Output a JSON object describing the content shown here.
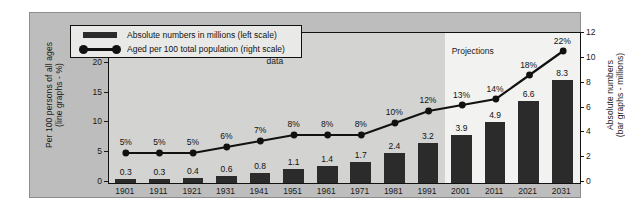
{
  "chart_data": {
    "type": "bar",
    "title": "",
    "xlabel": "",
    "categories": [
      "1901",
      "1911",
      "1921",
      "1931",
      "1941",
      "1951",
      "1961",
      "1971",
      "1981",
      "1991",
      "2001",
      "2011",
      "2021",
      "2031"
    ],
    "series": [
      {
        "name": "Absolute numbers in millions (left scale)",
        "type": "bar",
        "axis": "right",
        "values": [
          0.3,
          0.3,
          0.4,
          0.6,
          0.8,
          1.1,
          1.4,
          1.7,
          2.4,
          3.2,
          3.9,
          4.9,
          6.6,
          8.3
        ],
        "labels": [
          "0.3",
          "0.3",
          "0.4",
          "0.6",
          "0.8",
          "1.1",
          "1.4",
          "1.7",
          "2.4",
          "3.2",
          "3.9",
          "4.9",
          "6.6",
          "8.3"
        ]
      },
      {
        "name": "Aged per 100 total population (right scale)",
        "type": "line",
        "axis": "left",
        "values": [
          5,
          5,
          5,
          6,
          7,
          8,
          8,
          8,
          10,
          12,
          13,
          14,
          18,
          22
        ],
        "labels": [
          "5%",
          "5%",
          "5%",
          "6%",
          "7%",
          "8%",
          "8%",
          "8%",
          "10%",
          "12%",
          "13%",
          "14%",
          "18%",
          "22%"
        ]
      }
    ],
    "left_axis": {
      "label": "Per 100 persons of all ages\n(line graphs - %)",
      "label_line1": "Per 100 persons of all ages",
      "label_line2": "(line graphs - %)",
      "ticks": [
        "0",
        "5",
        "10",
        "15",
        "20",
        "25"
      ],
      "min": 0,
      "max": 25
    },
    "right_axis": {
      "label": "Absolute numbers\n(bar graphs - millions)",
      "label_line1": "Absolute numbers",
      "label_line2": "(bar graphs - millions)",
      "ticks": [
        "0",
        "2",
        "4",
        "6",
        "8",
        "10",
        "12"
      ],
      "min": 0,
      "max": 12
    },
    "grid": false,
    "legend_position": "top-left",
    "legend": [
      {
        "marker": "bar",
        "label": "Absolute numbers in millions (left scale)"
      },
      {
        "marker": "line-dot",
        "label": "Aged per 100 total population (right scale)"
      }
    ],
    "annotations": [
      {
        "name": "census-band",
        "label_line1": "Census",
        "label_line2": "data",
        "range": [
          "1901",
          "1991"
        ]
      },
      {
        "name": "projections-band",
        "label_line1": "Projections",
        "label_line2": "",
        "range": [
          "2001",
          "2031"
        ]
      }
    ],
    "colors": {
      "bar": "#2b2b2b",
      "line": "#111111",
      "plot_background": "#f2f2f0",
      "census_band": "#d3d3d1",
      "plate_background": "#bdbdbd",
      "page_background": "#ffffff"
    }
  }
}
